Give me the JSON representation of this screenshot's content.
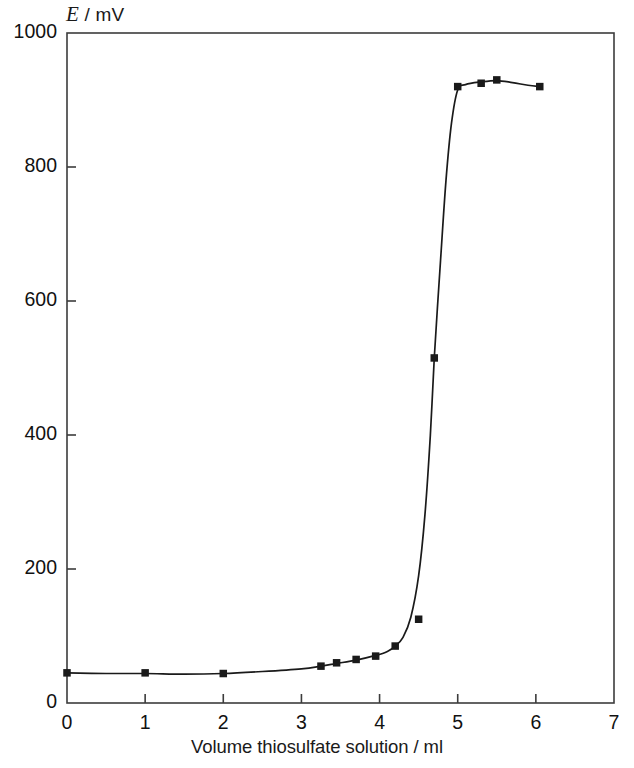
{
  "chart_data": {
    "type": "line",
    "title": "",
    "subtitle": "",
    "xlabel": "Volume thiosulfate solution / ml",
    "ylabel": "E / mV",
    "ylabel_symbol": "E",
    "ylabel_unit": "/ mV",
    "xlim": [
      0,
      7
    ],
    "ylim": [
      0,
      1000
    ],
    "xticks": [
      0,
      1,
      2,
      3,
      4,
      5,
      6,
      7
    ],
    "xtick_labels": [
      "0",
      "1",
      "2",
      "3",
      "4",
      "5",
      "6",
      "7"
    ],
    "yticks": [
      0,
      200,
      400,
      600,
      800,
      1000
    ],
    "ytick_labels": [
      "0",
      "200",
      "400",
      "600",
      "800",
      "1000"
    ],
    "grid": false,
    "legend": null,
    "tick_direction": "in",
    "marker": "square",
    "marker_color": "#1a1a1a",
    "line_color": "#1a1a1a",
    "frame_color": "#3c3c3c",
    "x": [
      0.0,
      1.0,
      2.0,
      3.25,
      3.45,
      3.7,
      3.95,
      4.2,
      4.5,
      4.7,
      5.0,
      5.3,
      5.5,
      6.05
    ],
    "y": [
      45,
      45,
      44,
      55,
      60,
      65,
      70,
      85,
      125,
      515,
      920,
      925,
      930,
      920
    ],
    "points": [
      {
        "x": 0.0,
        "y": 45
      },
      {
        "x": 1.0,
        "y": 45
      },
      {
        "x": 2.0,
        "y": 44
      },
      {
        "x": 3.25,
        "y": 55
      },
      {
        "x": 3.45,
        "y": 60
      },
      {
        "x": 3.7,
        "y": 65
      },
      {
        "x": 3.95,
        "y": 70
      },
      {
        "x": 4.2,
        "y": 85
      },
      {
        "x": 4.5,
        "y": 125
      },
      {
        "x": 4.7,
        "y": 515
      },
      {
        "x": 5.0,
        "y": 920
      },
      {
        "x": 5.3,
        "y": 925
      },
      {
        "x": 5.5,
        "y": 930
      },
      {
        "x": 6.05,
        "y": 920
      }
    ],
    "curve_note": "Smooth sigmoidal titration curve through points; the point at x=4.5, y=125 lies off the fitted curve.",
    "fitted_curve": [
      {
        "x": 0.0,
        "y": 45
      },
      {
        "x": 0.5,
        "y": 44
      },
      {
        "x": 1.0,
        "y": 44
      },
      {
        "x": 1.5,
        "y": 43
      },
      {
        "x": 2.0,
        "y": 44
      },
      {
        "x": 2.5,
        "y": 47
      },
      {
        "x": 3.0,
        "y": 51
      },
      {
        "x": 3.25,
        "y": 55
      },
      {
        "x": 3.45,
        "y": 59
      },
      {
        "x": 3.7,
        "y": 64
      },
      {
        "x": 3.95,
        "y": 71
      },
      {
        "x": 4.1,
        "y": 77
      },
      {
        "x": 4.2,
        "y": 85
      },
      {
        "x": 4.3,
        "y": 98
      },
      {
        "x": 4.4,
        "y": 128
      },
      {
        "x": 4.5,
        "y": 190
      },
      {
        "x": 4.58,
        "y": 280
      },
      {
        "x": 4.65,
        "y": 400
      },
      {
        "x": 4.7,
        "y": 515
      },
      {
        "x": 4.78,
        "y": 660
      },
      {
        "x": 4.85,
        "y": 780
      },
      {
        "x": 4.92,
        "y": 865
      },
      {
        "x": 5.0,
        "y": 915
      },
      {
        "x": 5.1,
        "y": 923
      },
      {
        "x": 5.3,
        "y": 927
      },
      {
        "x": 5.5,
        "y": 929
      },
      {
        "x": 5.7,
        "y": 926
      },
      {
        "x": 5.9,
        "y": 922
      },
      {
        "x": 6.05,
        "y": 920
      }
    ]
  }
}
